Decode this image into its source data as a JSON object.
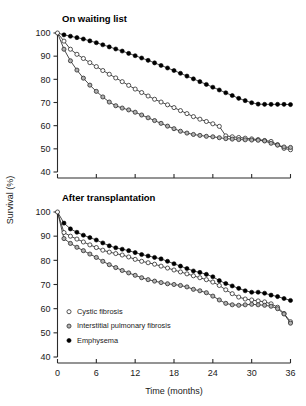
{
  "figure": {
    "caption": "",
    "y_axis_label": "Survival (%)",
    "x_axis_label": "Time (months)"
  },
  "legend": {
    "position": "bottom-left-of-lower-panel",
    "entries": [
      {
        "label": "Cystic fibrosis",
        "marker": "open-circle",
        "fill": "#ffffff",
        "stroke": "#2b2b2b"
      },
      {
        "label": "Interstitial pulmonary fibrosis",
        "marker": "gray-circle",
        "fill": "#b3b3b3",
        "stroke": "#2b2b2b"
      },
      {
        "label": "Emphysema",
        "marker": "filled-circle",
        "fill": "#000000",
        "stroke": "#000000"
      }
    ]
  },
  "chart_data": [
    {
      "type": "line",
      "title": "On waiting list",
      "xlabel": "",
      "ylabel": "Survival (%)",
      "xlim": [
        0,
        36
      ],
      "ylim": [
        40,
        100
      ],
      "xticks": [
        0,
        6,
        12,
        18,
        24,
        30,
        36
      ],
      "xticklabels": [
        "",
        "",
        "",
        "",
        "",
        "",
        ""
      ],
      "yticks": [
        40,
        50,
        60,
        70,
        80,
        90,
        100
      ],
      "yticklabels": [
        "40",
        "50",
        "60",
        "70",
        "80",
        "90",
        "100"
      ],
      "grid": false,
      "legend_position": "none",
      "x": [
        0,
        1,
        2,
        3,
        4,
        5,
        6,
        7,
        8,
        9,
        10,
        11,
        12,
        13,
        14,
        15,
        16,
        17,
        18,
        19,
        20,
        21,
        22,
        23,
        24,
        25,
        26,
        27,
        28,
        29,
        30,
        31,
        32,
        33,
        34,
        35,
        36
      ],
      "series": [
        {
          "name": "Cystic fibrosis",
          "values": [
            100.0,
            96.5,
            93.0,
            90.8,
            89.0,
            87.2,
            85.5,
            83.8,
            82.2,
            80.6,
            79.0,
            77.4,
            75.8,
            74.3,
            72.8,
            71.4,
            70.2,
            69.0,
            67.8,
            66.5,
            65.2,
            63.9,
            62.8,
            61.8,
            60.8,
            59.7,
            55.6,
            55.2,
            54.9,
            54.6,
            54.3,
            54.0,
            53.6,
            53.2,
            51.8,
            50.2,
            49.6
          ]
        },
        {
          "name": "Interstitial pulmonary fibrosis",
          "values": [
            100.0,
            93.0,
            88.0,
            84.0,
            80.5,
            77.5,
            74.8,
            72.4,
            70.2,
            68.6,
            67.6,
            66.8,
            65.8,
            64.6,
            63.4,
            62.2,
            61.0,
            59.8,
            58.7,
            57.6,
            56.8,
            56.2,
            55.8,
            55.4,
            55.2,
            54.8,
            54.4,
            54.2,
            54.0,
            53.9,
            53.8,
            53.7,
            53.4,
            52.4,
            51.6,
            50.8,
            50.6
          ]
        },
        {
          "name": "Emphysema",
          "values": [
            100.0,
            99.2,
            98.6,
            98.0,
            97.4,
            96.6,
            95.8,
            94.9,
            94.0,
            93.1,
            92.2,
            91.2,
            90.2,
            89.2,
            88.2,
            87.1,
            86.0,
            84.9,
            83.8,
            82.6,
            81.4,
            80.2,
            79.0,
            77.8,
            76.6,
            75.4,
            74.2,
            73.0,
            71.8,
            70.8,
            69.9,
            69.3,
            69.2,
            69.2,
            69.2,
            69.2,
            69.1
          ]
        }
      ]
    },
    {
      "type": "line",
      "title": "After transplantation",
      "xlabel": "Time (months)",
      "ylabel": "Survival (%)",
      "xlim": [
        0,
        36
      ],
      "ylim": [
        40,
        100
      ],
      "xticks": [
        0,
        6,
        12,
        18,
        24,
        30,
        36
      ],
      "xticklabels": [
        "0",
        "6",
        "12",
        "18",
        "24",
        "30",
        "36"
      ],
      "yticks": [
        40,
        50,
        60,
        70,
        80,
        90,
        100
      ],
      "yticklabels": [
        "40",
        "50",
        "60",
        "70",
        "80",
        "90",
        "100"
      ],
      "grid": false,
      "legend_position": "lower-left-inside",
      "x": [
        0,
        1,
        2,
        3,
        4,
        5,
        6,
        7,
        8,
        9,
        10,
        11,
        12,
        13,
        14,
        15,
        16,
        17,
        18,
        19,
        20,
        21,
        22,
        23,
        24,
        25,
        26,
        27,
        28,
        29,
        30,
        31,
        32,
        33,
        34,
        35,
        36
      ],
      "series": [
        {
          "name": "Cystic fibrosis",
          "values": [
            100.0,
            91.5,
            90.0,
            88.8,
            87.6,
            86.4,
            85.3,
            84.2,
            83.4,
            82.8,
            82.2,
            81.4,
            80.4,
            79.6,
            79.0,
            78.4,
            77.6,
            76.8,
            76.0,
            75.2,
            74.4,
            73.6,
            72.8,
            72.0,
            71.0,
            69.6,
            67.8,
            66.2,
            64.8,
            64.0,
            63.6,
            63.2,
            62.8,
            62.0,
            60.6,
            58.0,
            54.6
          ]
        },
        {
          "name": "Interstitial pulmonary fibrosis",
          "values": [
            100.0,
            89.0,
            87.0,
            85.4,
            84.0,
            82.6,
            81.2,
            79.6,
            78.2,
            77.0,
            75.8,
            74.8,
            73.8,
            72.8,
            72.0,
            71.4,
            70.8,
            70.3,
            70.0,
            69.6,
            69.0,
            68.0,
            67.4,
            66.6,
            65.2,
            63.6,
            62.2,
            61.6,
            61.4,
            61.6,
            61.8,
            61.6,
            61.4,
            61.0,
            60.0,
            57.8,
            54.0
          ]
        },
        {
          "name": "Emphysema",
          "values": [
            100.0,
            95.4,
            93.0,
            91.6,
            90.4,
            89.4,
            88.4,
            87.2,
            86.0,
            85.2,
            84.6,
            84.0,
            83.2,
            82.4,
            81.8,
            81.2,
            80.6,
            79.6,
            78.6,
            77.6,
            76.6,
            75.6,
            75.0,
            74.2,
            73.2,
            71.6,
            70.4,
            69.4,
            68.4,
            67.4,
            66.8,
            66.8,
            66.4,
            65.6,
            65.0,
            64.2,
            63.4
          ]
        }
      ]
    }
  ]
}
